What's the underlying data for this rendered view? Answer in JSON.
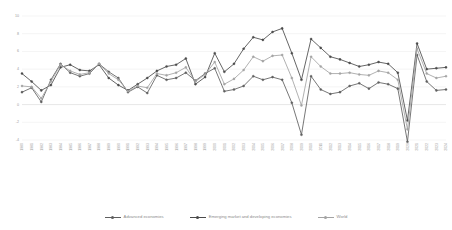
{
  "chart_data": {
    "type": "line",
    "title": "",
    "subtitle": "",
    "xlabel": "",
    "ylabel": "",
    "ylim": [
      -4,
      10
    ],
    "yticks": [
      -4,
      -2,
      0,
      2,
      4,
      6,
      8,
      10
    ],
    "ytick_labels": [
      "-4",
      "-2",
      "0",
      "2",
      "4",
      "6",
      "8",
      "10"
    ],
    "grid": true,
    "legend_position": "bottom",
    "x": [
      "1980",
      "1981",
      "1982",
      "1983",
      "1984",
      "1985",
      "1986",
      "1987",
      "1988",
      "1989",
      "1990",
      "1991",
      "1992",
      "1993",
      "1994",
      "1995",
      "1996",
      "1997",
      "1998",
      "1999",
      "2000",
      "2001",
      "2002",
      "2003",
      "2004",
      "2005",
      "2006",
      "2007",
      "2008",
      "2009",
      "2010",
      "2011",
      "2012",
      "2013",
      "2014",
      "2015",
      "2016",
      "2017",
      "2018",
      "2019",
      "2020",
      "2021",
      "2022",
      "2023",
      "2024"
    ],
    "categories": [
      "1980",
      "1981",
      "1982",
      "1983",
      "1984",
      "1985",
      "1986",
      "1987",
      "1988",
      "1989",
      "1990",
      "1991",
      "1992",
      "1993",
      "1994",
      "1995",
      "1996",
      "1997",
      "1998",
      "1999",
      "2000",
      "2001",
      "2002",
      "2003",
      "2004",
      "2005",
      "2006",
      "2007",
      "2008",
      "2009",
      "2010",
      "2011",
      "2012",
      "2013",
      "2014",
      "2015",
      "2016",
      "2017",
      "2018",
      "2019",
      "2020",
      "2021",
      "2022",
      "2023",
      "2024"
    ],
    "series": [
      {
        "name": "Advanced economies",
        "color": "#5f5f5f",
        "values": [
          1.4,
          1.9,
          0.3,
          2.8,
          4.6,
          3.6,
          3.2,
          3.5,
          4.6,
          3.7,
          3.0,
          1.4,
          2.0,
          1.3,
          3.3,
          2.8,
          3.0,
          3.6,
          2.7,
          3.5,
          4.1,
          1.5,
          1.7,
          2.1,
          3.2,
          2.8,
          3.1,
          2.8,
          0.2,
          -3.4,
          3.2,
          1.7,
          1.2,
          1.4,
          2.1,
          2.4,
          1.8,
          2.5,
          2.3,
          1.8,
          -4.2,
          5.6,
          2.6,
          1.6,
          1.7
        ]
      },
      {
        "name": "Emerging market and developing economies",
        "color": "#4a4a4a",
        "values": [
          3.5,
          2.6,
          1.6,
          2.2,
          4.2,
          4.5,
          3.9,
          3.8,
          4.5,
          3.0,
          2.2,
          1.6,
          2.3,
          3.0,
          3.8,
          4.3,
          4.5,
          5.2,
          2.3,
          3.1,
          5.8,
          3.7,
          4.6,
          6.3,
          7.6,
          7.3,
          8.2,
          8.6,
          5.8,
          2.8,
          7.4,
          6.4,
          5.4,
          5.1,
          4.7,
          4.3,
          4.5,
          4.8,
          4.6,
          3.6,
          -1.8,
          6.9,
          4.0,
          4.1,
          4.2
        ]
      },
      {
        "name": "World",
        "color": "#a3a3a3",
        "values": [
          2.1,
          2.0,
          0.7,
          2.6,
          4.5,
          3.8,
          3.4,
          3.6,
          4.6,
          3.5,
          2.8,
          1.5,
          2.1,
          1.9,
          3.5,
          3.3,
          3.6,
          4.2,
          2.6,
          3.4,
          4.8,
          2.3,
          2.9,
          3.9,
          5.4,
          4.9,
          5.5,
          5.6,
          3.0,
          -0.1,
          5.4,
          4.3,
          3.5,
          3.5,
          3.6,
          3.4,
          3.3,
          3.8,
          3.6,
          2.8,
          -2.8,
          6.3,
          3.5,
          3.0,
          3.2
        ]
      }
    ]
  },
  "legend": {
    "items": [
      {
        "label": "Advanced economies",
        "color": "#5f5f5f"
      },
      {
        "label": "Emerging market and developing economies",
        "color": "#4a4a4a"
      },
      {
        "label": "World",
        "color": "#a3a3a3"
      }
    ]
  }
}
